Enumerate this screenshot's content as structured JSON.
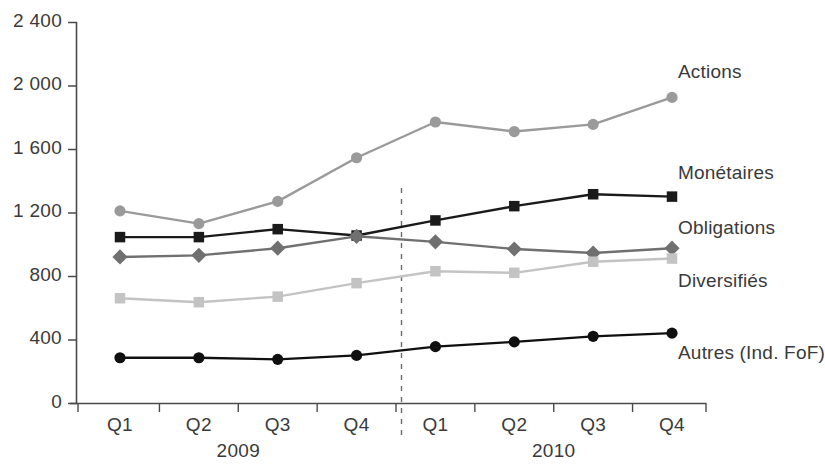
{
  "chart_data": {
    "type": "line",
    "title": "",
    "xlabel": "",
    "ylabel": "",
    "ylim": [
      0,
      2400
    ],
    "ytick_labels": [
      "0",
      "400",
      "800",
      "1 200",
      "1 600",
      "2 000",
      "2 400"
    ],
    "ytick_values": [
      0,
      400,
      800,
      1200,
      1600,
      2000,
      2400
    ],
    "grid": false,
    "legend_position": "right-inline",
    "categories": [
      "Q1",
      "Q2",
      "Q3",
      "Q4",
      "Q1",
      "Q2",
      "Q3",
      "Q4"
    ],
    "groups": [
      {
        "label": "2009",
        "quarters": [
          "Q1",
          "Q2",
          "Q3",
          "Q4"
        ]
      },
      {
        "label": "2010",
        "quarters": [
          "Q1",
          "Q2",
          "Q3",
          "Q4"
        ]
      }
    ],
    "annotations": [
      {
        "type": "vertical-dashed-line",
        "between": [
          "2009 Q4",
          "2010 Q1"
        ]
      }
    ],
    "series": [
      {
        "name": "Actions",
        "color": "#9a9a9a",
        "marker": "circle",
        "values": [
          1210,
          1130,
          1270,
          1545,
          1770,
          1710,
          1755,
          1925
        ]
      },
      {
        "name": "Monétaires",
        "color": "#1a1a1a",
        "marker": "square",
        "values": [
          1045,
          1045,
          1095,
          1055,
          1150,
          1240,
          1315,
          1300
        ]
      },
      {
        "name": "Obligations",
        "color": "#707070",
        "marker": "diamond",
        "values": [
          920,
          930,
          975,
          1050,
          1015,
          970,
          945,
          975
        ]
      },
      {
        "name": "Diversifiés",
        "color": "#c3c3c3",
        "marker": "square",
        "values": [
          660,
          635,
          670,
          755,
          830,
          820,
          890,
          910
        ]
      },
      {
        "name": "Autres (Ind. FoF)",
        "color": "#101010",
        "marker": "circle",
        "values": [
          285,
          285,
          275,
          300,
          355,
          385,
          420,
          440
        ]
      }
    ]
  },
  "axis": {
    "y_ticks": [
      {
        "label": "2 400"
      },
      {
        "label": "2 000"
      },
      {
        "label": "1 600"
      },
      {
        "label": "1 200"
      },
      {
        "label": "800"
      },
      {
        "label": "400"
      },
      {
        "label": "0"
      }
    ],
    "x_ticks": [
      {
        "label": "Q1"
      },
      {
        "label": "Q2"
      },
      {
        "label": "Q3"
      },
      {
        "label": "Q4"
      },
      {
        "label": "Q1"
      },
      {
        "label": "Q2"
      },
      {
        "label": "Q3"
      },
      {
        "label": "Q4"
      }
    ],
    "years": [
      {
        "label": "2009"
      },
      {
        "label": "2010"
      }
    ]
  },
  "series_labels": [
    {
      "name": "Actions"
    },
    {
      "name": "Monétaires"
    },
    {
      "name": "Obligations"
    },
    {
      "name": "Diversifiés"
    },
    {
      "name": "Autres (Ind. FoF)"
    }
  ]
}
